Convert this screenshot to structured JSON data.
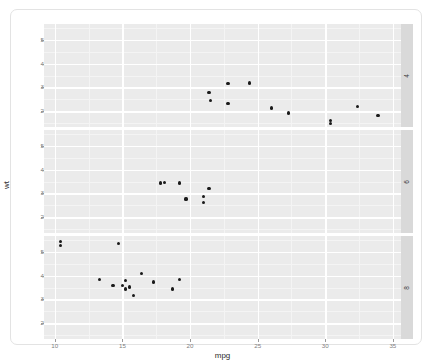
{
  "chart_data": {
    "type": "scatter",
    "title": "",
    "xlabel": "mpg",
    "ylabel": "wt",
    "xlim": [
      9.2,
      35.6
    ],
    "ylim": [
      1.35,
      5.65
    ],
    "xticks": [
      10,
      15,
      20,
      25,
      30,
      35
    ],
    "yticks": [
      2,
      3,
      4,
      5
    ],
    "grid": true,
    "legend": "none",
    "facet": {
      "variable": "cyl",
      "position": "right",
      "direction": "vertical",
      "levels": [
        "4",
        "6",
        "8"
      ]
    },
    "panels": [
      {
        "strip": "4",
        "points": [
          {
            "mpg": 22.8,
            "wt": 2.32
          },
          {
            "mpg": 24.4,
            "wt": 3.19
          },
          {
            "mpg": 22.8,
            "wt": 3.15
          },
          {
            "mpg": 32.4,
            "wt": 2.2
          },
          {
            "mpg": 30.4,
            "wt": 1.615
          },
          {
            "mpg": 33.9,
            "wt": 1.835
          },
          {
            "mpg": 21.5,
            "wt": 2.465
          },
          {
            "mpg": 27.3,
            "wt": 1.935
          },
          {
            "mpg": 26.0,
            "wt": 2.14
          },
          {
            "mpg": 30.4,
            "wt": 1.513
          },
          {
            "mpg": 21.4,
            "wt": 2.78
          }
        ]
      },
      {
        "strip": "6",
        "points": [
          {
            "mpg": 21.0,
            "wt": 2.62
          },
          {
            "mpg": 21.0,
            "wt": 2.875
          },
          {
            "mpg": 21.4,
            "wt": 3.215
          },
          {
            "mpg": 18.1,
            "wt": 3.46
          },
          {
            "mpg": 19.2,
            "wt": 3.44
          },
          {
            "mpg": 17.8,
            "wt": 3.44
          },
          {
            "mpg": 19.7,
            "wt": 2.77
          }
        ]
      },
      {
        "strip": "8",
        "points": [
          {
            "mpg": 18.7,
            "wt": 3.44
          },
          {
            "mpg": 14.3,
            "wt": 3.57
          },
          {
            "mpg": 16.4,
            "wt": 4.07
          },
          {
            "mpg": 17.3,
            "wt": 3.73
          },
          {
            "mpg": 15.2,
            "wt": 3.78
          },
          {
            "mpg": 10.4,
            "wt": 5.25
          },
          {
            "mpg": 10.4,
            "wt": 5.424
          },
          {
            "mpg": 14.7,
            "wt": 5.345
          },
          {
            "mpg": 15.5,
            "wt": 3.52
          },
          {
            "mpg": 15.2,
            "wt": 3.435
          },
          {
            "mpg": 13.3,
            "wt": 3.84
          },
          {
            "mpg": 19.2,
            "wt": 3.845
          },
          {
            "mpg": 15.8,
            "wt": 3.17
          },
          {
            "mpg": 15.0,
            "wt": 3.57
          }
        ]
      }
    ]
  }
}
